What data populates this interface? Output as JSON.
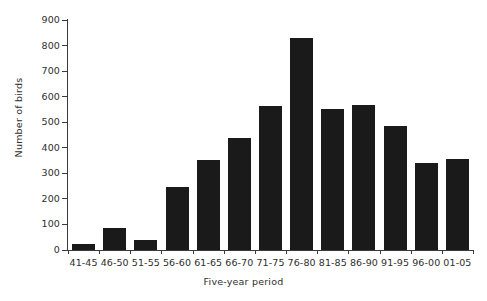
{
  "chart_data": {
    "type": "bar",
    "title": "",
    "xlabel": "Five-year period",
    "ylabel": "Number of birds",
    "categories": [
      "41-45",
      "46-50",
      "51-55",
      "56-60",
      "61-65",
      "66-70",
      "71-75",
      "76-80",
      "81-85",
      "86-90",
      "91-95",
      "96-00",
      "01-05"
    ],
    "values": [
      25,
      88,
      38,
      248,
      352,
      440,
      562,
      828,
      550,
      568,
      487,
      340,
      358
    ],
    "ylim": [
      0,
      900
    ],
    "ytick_step": 100,
    "yticks": [
      "900",
      "800",
      "700",
      "600",
      "500",
      "400",
      "300",
      "200",
      "100",
      "0"
    ],
    "ytick_values": [
      900,
      800,
      700,
      600,
      500,
      400,
      300,
      200,
      100,
      0
    ],
    "grid": false,
    "legend": null,
    "bar_color": "#1a1a1a",
    "axis_color": "#3a3a3a",
    "text_color": "#2e2e2e",
    "background_color": "#ffffff"
  }
}
